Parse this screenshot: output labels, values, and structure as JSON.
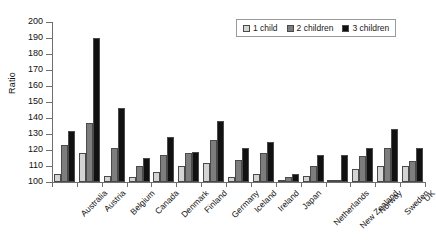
{
  "chart_data": {
    "type": "bar",
    "title": "",
    "subtitle": "",
    "xlabel": "",
    "ylabel": "Ratio",
    "ylim": [
      100,
      200
    ],
    "ytick_step": 10,
    "yticks": [
      100,
      110,
      120,
      130,
      140,
      150,
      160,
      170,
      180,
      190,
      200
    ],
    "grid": false,
    "legend_position": "top-right",
    "categories": [
      "Australia",
      "Austria",
      "Belgium",
      "Canada",
      "Denmark",
      "Finland",
      "Germany",
      "Iceland",
      "Ireland",
      "Japan",
      "Netherlands",
      "New Zealand",
      "Norway",
      "Sweden",
      "UK"
    ],
    "series": [
      {
        "name": "1 child",
        "color": "#d4d4d4",
        "values": [
          105,
          118,
          104,
          103,
          106,
          110,
          112,
          103,
          105,
          101,
          104,
          100,
          108,
          110,
          110
        ]
      },
      {
        "name": "2 children",
        "color": "#7d7d7d",
        "values": [
          123,
          137,
          121,
          110,
          117,
          118,
          126,
          114,
          118,
          103,
          110,
          100,
          116,
          121,
          113
        ]
      },
      {
        "name": "3 children",
        "color": "#111111",
        "values": [
          132,
          190,
          146,
          115,
          128,
          119,
          138,
          121,
          125,
          105,
          117,
          117,
          121,
          133,
          121
        ]
      }
    ]
  },
  "legend": {
    "items": [
      {
        "label": "1 child"
      },
      {
        "label": "2 children"
      },
      {
        "label": "3 children"
      }
    ]
  }
}
